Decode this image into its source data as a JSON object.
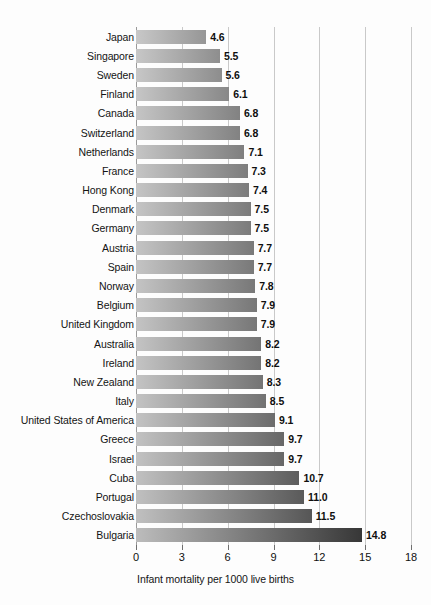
{
  "chart_data": {
    "type": "bar",
    "orientation": "horizontal",
    "title": "",
    "subtitle": "",
    "xlabel": "Infant mortality per 1000 live births",
    "ylabel": "",
    "xlim": [
      0,
      18
    ],
    "xticks": [
      0,
      3,
      6,
      9,
      12,
      15,
      18
    ],
    "xtick_labels": [
      "0",
      "3",
      "6",
      "9",
      "12",
      "15",
      "18"
    ],
    "grid": true,
    "grid_axis": "x",
    "legend": false,
    "legend_position": "none",
    "sort": "ascending",
    "bar_style": {
      "fill": "horizontal-gradient",
      "gradient_start": "#c3c3c3",
      "gradient_end": "#555555"
    },
    "categories": [
      "Japan",
      "Singapore",
      "Sweden",
      "Finland",
      "Canada",
      "Switzerland",
      "Netherlands",
      "France",
      "Hong Kong",
      "Denmark",
      "Germany",
      "Austria",
      "Spain",
      "Norway",
      "Belgium",
      "United Kingdom",
      "Australia",
      "Ireland",
      "New Zealand",
      "Italy",
      "United States of America",
      "Greece",
      "Israel",
      "Cuba",
      "Portugal",
      "Czechoslovakia",
      "Bulgaria"
    ],
    "values": [
      4.6,
      5.5,
      5.6,
      6.1,
      6.8,
      6.8,
      7.1,
      7.3,
      7.4,
      7.5,
      7.5,
      7.7,
      7.7,
      7.8,
      7.9,
      7.9,
      8.2,
      8.2,
      8.3,
      8.5,
      9.1,
      9.7,
      9.7,
      10.7,
      11.0,
      11.5,
      14.8
    ],
    "value_labels": [
      "4.6",
      "5.5",
      "5.6",
      "6.1",
      "6.8",
      "6.8",
      "7.1",
      "7.3",
      "7.4",
      "7.5",
      "7.5",
      "7.7",
      "7.7",
      "7.8",
      "7.9",
      "7.9",
      "8.2",
      "8.2",
      "8.3",
      "8.5",
      "9.1",
      "9.7",
      "9.7",
      "10.7",
      "11.0",
      "11.5",
      "14.8"
    ]
  }
}
